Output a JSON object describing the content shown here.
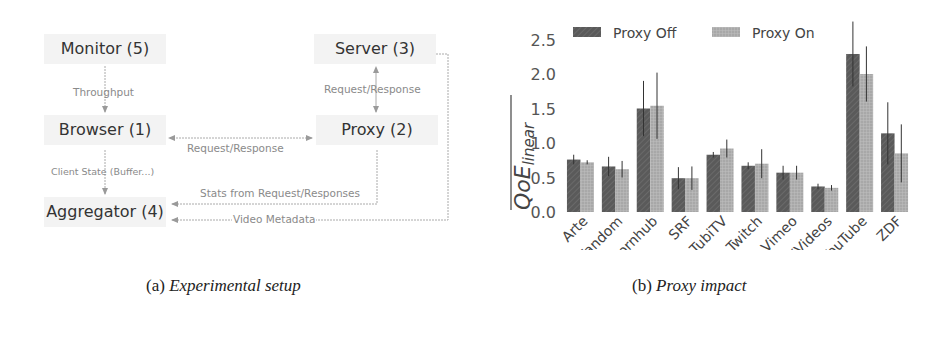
{
  "figure_a": {
    "caption_prefix": "(a)",
    "caption_title": "Experimental setup",
    "nodes": {
      "monitor": "Monitor (5)",
      "server": "Server (3)",
      "browser": "Browser (1)",
      "proxy": "Proxy (2)",
      "aggregator": "Aggregator (4)"
    },
    "edges": {
      "throughput": "Throughput",
      "server_proxy": "Request/Response",
      "browser_proxy": "Request/Response",
      "client_state": "Client State (Buffer...)",
      "stats": "Stats from Request/Responses",
      "video_metadata": "Video Metadata"
    }
  },
  "figure_b": {
    "caption_prefix": "(b)",
    "caption_title": "Proxy impact"
  },
  "colors": {
    "proxy_off": "#5a5a5a",
    "proxy_on": "#a8a8a8",
    "edge": "#9a9a9a",
    "node_bg": "#f3f3f3"
  },
  "chart_data": {
    "type": "bar",
    "title": "Proxy impact",
    "xlabel": "",
    "ylabel": "QoE_linear (mean)",
    "ylim": [
      0,
      2.75
    ],
    "yticks": [
      0.0,
      0.5,
      1.0,
      1.5,
      2.0,
      2.5
    ],
    "ytick_labels": [
      "0.0",
      "0.5",
      "1.0",
      "1.5",
      "2.0",
      "2.5"
    ],
    "grid": false,
    "legend_position": "upper left",
    "categories": [
      "Arte",
      "Fandom",
      "Pornhub",
      "SRF",
      "TubiTV",
      "Twitch",
      "Vimeo",
      "XVideos",
      "YouTube",
      "ZDF"
    ],
    "series": [
      {
        "name": "Proxy Off",
        "hatch": "diagonal",
        "values": [
          0.76,
          0.66,
          1.5,
          0.49,
          0.83,
          0.67,
          0.57,
          0.37,
          2.29,
          1.14
        ],
        "errors": [
          0.07,
          0.14,
          0.4,
          0.16,
          0.04,
          0.05,
          0.1,
          0.04,
          0.47,
          0.45
        ]
      },
      {
        "name": "Proxy On",
        "hatch": "grid",
        "values": [
          0.72,
          0.62,
          1.54,
          0.49,
          0.92,
          0.7,
          0.57,
          0.35,
          2.0,
          0.85
        ],
        "errors": [
          0.03,
          0.12,
          0.48,
          0.17,
          0.13,
          0.21,
          0.1,
          0.04,
          0.4,
          0.42
        ]
      }
    ]
  }
}
